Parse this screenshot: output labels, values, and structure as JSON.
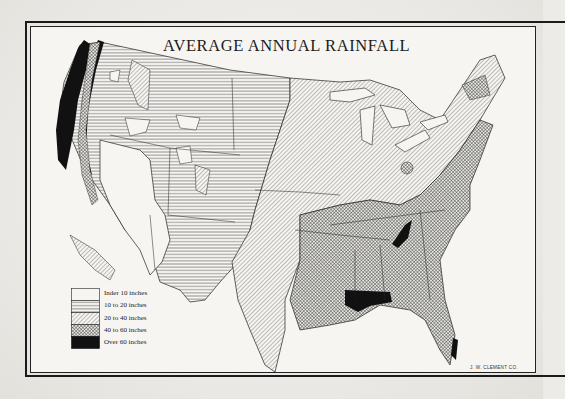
{
  "map": {
    "title": "AVERAGE ANNUAL RAINFALL",
    "subject": "Contiguous United States",
    "credit": "J. W. CLEMENT CO.",
    "colors": {
      "paper": "#f6f5f2",
      "ink": "#1a1a1a",
      "background": "#ecebe8"
    }
  },
  "legend": {
    "items": [
      {
        "label": "Inder 10 inches",
        "pattern": "blank"
      },
      {
        "label": "10 to 20 inches",
        "pattern": "horizontal-lines"
      },
      {
        "label": "20 to 40 inches",
        "pattern": "diagonal-lines"
      },
      {
        "label": "40 to 60 inches",
        "pattern": "crosshatch"
      },
      {
        "label": "Over 60 inches",
        "pattern": "solid-black"
      }
    ]
  }
}
